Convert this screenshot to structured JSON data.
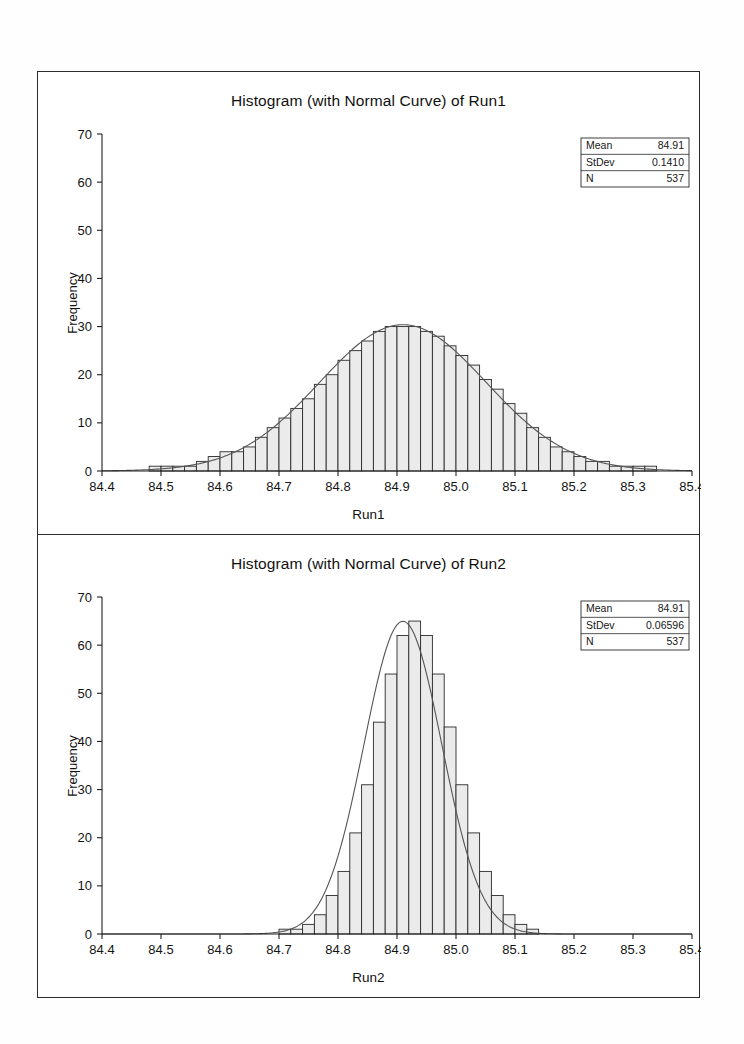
{
  "document": {
    "page_width": 744,
    "page_height": 1044,
    "background": "#ffffff",
    "frame_color": "#2b2b2b"
  },
  "charts": [
    {
      "id": "run1",
      "title": "Histogram (with Normal Curve) of Run1",
      "xlabel": "Run1",
      "ylabel": "Frequency",
      "legend": {
        "rows": [
          {
            "label": "Mean",
            "value": "84.91"
          },
          {
            "label": "StDev",
            "value": "0.1410"
          },
          {
            "label": "N",
            "value": "537"
          }
        ]
      }
    },
    {
      "id": "run2",
      "title": "Histogram (with Normal Curve) of Run2",
      "xlabel": "Run2",
      "ylabel": "Frequency",
      "legend": {
        "rows": [
          {
            "label": "Mean",
            "value": "84.91"
          },
          {
            "label": "StDev",
            "value": "0.06596"
          },
          {
            "label": "N",
            "value": "537"
          }
        ]
      }
    }
  ],
  "chart_data": [
    {
      "type": "bar",
      "id": "run1",
      "title": "Histogram (with Normal Curve) of Run1",
      "xlabel": "Run1",
      "ylabel": "Frequency",
      "xlim": [
        84.4,
        85.4
      ],
      "ylim": [
        0,
        70
      ],
      "xticks": [
        "84.4",
        "84.5",
        "84.6",
        "84.7",
        "84.8",
        "84.9",
        "85.0",
        "85.1",
        "85.2",
        "85.3",
        "85.4"
      ],
      "yticks": [
        "0",
        "10",
        "20",
        "30",
        "40",
        "50",
        "60",
        "70"
      ],
      "grid": false,
      "legend_position": "top-right",
      "bin_width": 0.02,
      "bin_starts": [
        84.46,
        84.48,
        84.5,
        84.52,
        84.54,
        84.56,
        84.58,
        84.6,
        84.62,
        84.64,
        84.66,
        84.68,
        84.7,
        84.72,
        84.74,
        84.76,
        84.78,
        84.8,
        84.82,
        84.84,
        84.86,
        84.88,
        84.9,
        84.92,
        84.94,
        84.96,
        84.98,
        85.0,
        85.02,
        85.04,
        85.06,
        85.08,
        85.1,
        85.12,
        85.14,
        85.16,
        85.18,
        85.2,
        85.22,
        85.24,
        85.26,
        85.28,
        85.3,
        85.32
      ],
      "values": [
        0,
        1,
        1,
        1,
        1,
        2,
        3,
        4,
        4,
        5,
        7,
        9,
        11,
        13,
        15,
        18,
        20,
        23,
        25,
        27,
        29,
        30,
        30,
        30,
        29,
        28,
        26,
        24,
        22,
        19,
        17,
        14,
        12,
        9,
        7,
        5,
        4,
        3,
        2,
        2,
        1,
        1,
        1,
        1
      ],
      "normal_curve": {
        "mean": 84.91,
        "stdev": 0.141,
        "n": 537,
        "scale_bin_width": 0.02
      },
      "annotations": {
        "Mean": "84.91",
        "StDev": "0.1410",
        "N": "537"
      }
    },
    {
      "type": "bar",
      "id": "run2",
      "title": "Histogram (with Normal Curve) of Run2",
      "xlabel": "Run2",
      "ylabel": "Frequency",
      "xlim": [
        84.4,
        85.4
      ],
      "ylim": [
        0,
        70
      ],
      "xticks": [
        "84.4",
        "84.5",
        "84.6",
        "84.7",
        "84.8",
        "84.9",
        "85.0",
        "85.1",
        "85.2",
        "85.3",
        "85.4"
      ],
      "yticks": [
        "0",
        "10",
        "20",
        "30",
        "40",
        "50",
        "60",
        "70"
      ],
      "grid": false,
      "legend_position": "top-right",
      "bin_width": 0.02,
      "bin_starts": [
        84.7,
        84.72,
        84.74,
        84.76,
        84.78,
        84.8,
        84.82,
        84.84,
        84.86,
        84.88,
        84.9,
        84.92,
        84.94,
        84.96,
        84.98,
        85.0,
        85.02,
        85.04,
        85.06,
        85.08,
        85.1,
        85.12
      ],
      "values": [
        1,
        1,
        2,
        4,
        8,
        13,
        21,
        31,
        44,
        54,
        62,
        65,
        62,
        54,
        43,
        31,
        21,
        13,
        8,
        4,
        2,
        1
      ],
      "normal_curve": {
        "mean": 84.91,
        "stdev": 0.06596,
        "n": 537,
        "scale_bin_width": 0.02
      },
      "annotations": {
        "Mean": "84.91",
        "StDev": "0.06596",
        "N": "537"
      }
    }
  ]
}
